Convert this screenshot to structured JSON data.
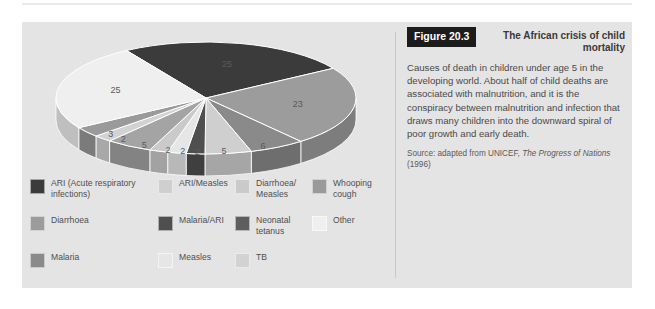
{
  "figure": {
    "tag": "Figure 20.3",
    "title": "The African crisis of child mortality",
    "body": "Causes of death in children under age 5 in the developing world. About half of child deaths are associated with malnutrition, and it is the conspiracy between malnutrition and infection that draws many children into the downward spiral of poor growth and early death.",
    "source_prefix": "Source: adapted from UNICEF, ",
    "source_italic": "The Progress of Nations",
    "source_suffix": " (1996)"
  },
  "palette": {
    "panel_background": "#e4e4e4",
    "page_background": "#ffffff",
    "divider": "#c9c9c9",
    "tag_background": "#1c1c1c",
    "tag_text": "#ffffff",
    "text": "#4a4a4a"
  },
  "chart_data": {
    "type": "pie",
    "title": "The African crisis of child mortality",
    "value_unit": "percent",
    "total": 100,
    "legend_position": "below",
    "categories": [
      "ARI (Acute respiratory infections)",
      "Diarrhoea",
      "Malaria",
      "ARI/Measles",
      "Malaria/ARI",
      "Measles",
      "Diarrhoea/Measles",
      "Neonatal tetanus",
      "TB",
      "Whooping cough",
      "Other"
    ],
    "values": [
      25,
      23,
      6,
      5,
      2,
      2,
      2,
      5,
      2,
      3,
      25
    ],
    "slices": [
      {
        "label": "ARI (Acute respiratory infections)",
        "value": 25,
        "color": "#3b3b3b",
        "data_label": "25"
      },
      {
        "label": "Diarrhoea",
        "value": 23,
        "color": "#9c9c9c",
        "data_label": "23"
      },
      {
        "label": "Malaria",
        "value": 6,
        "color": "#8a8a8a",
        "data_label": "6"
      },
      {
        "label": "ARI/Measles",
        "value": 5,
        "color": "#cfcfcf",
        "data_label": "5"
      },
      {
        "label": "Malaria/ARI",
        "value": 2,
        "color": "#4f4f4f",
        "data_label": "2"
      },
      {
        "label": "Measles",
        "value": 2,
        "color": "#e6e6e6",
        "data_label": "2"
      },
      {
        "label": "Diarrhoea/Measles",
        "value": 2,
        "color": "#cacaca",
        "data_label": "2"
      },
      {
        "label": "Neonatal tetanus",
        "value": 5,
        "color": "#a4a4a4",
        "data_label": "5"
      },
      {
        "label": "TB",
        "value": 2,
        "color": "#d2d2d2",
        "data_label": "2"
      },
      {
        "label": "Whooping cough",
        "value": 3,
        "color": "#9a9a9a",
        "data_label": "3"
      },
      {
        "label": "Other",
        "value": 25,
        "color": "#efefef",
        "data_label": "25"
      }
    ]
  },
  "legend": {
    "rows": [
      [
        {
          "label": "ARI (Acute respiratory\ninfections)",
          "color": "#3b3b3b"
        },
        {
          "label": "ARI/Measles",
          "color": "#cfcfcf"
        },
        {
          "label": "Diarrhoea/\nMeasles",
          "color": "#cacaca"
        },
        {
          "label": "Whooping\ncough",
          "color": "#9a9a9a"
        }
      ],
      [
        {
          "label": "Diarrhoea",
          "color": "#9c9c9c"
        },
        {
          "label": "Malaria/ARI",
          "color": "#4f4f4f"
        },
        {
          "label": "Neonatal\ntetanus",
          "color": "#5e5e5e"
        },
        {
          "label": "Other",
          "color": "#efefef"
        }
      ],
      [
        {
          "label": "Malaria",
          "color": "#8a8a8a"
        },
        {
          "label": "Measles",
          "color": "#e6e6e6"
        },
        {
          "label": "TB",
          "color": "#d2d2d2"
        },
        {
          "label": "",
          "color": ""
        }
      ]
    ]
  }
}
